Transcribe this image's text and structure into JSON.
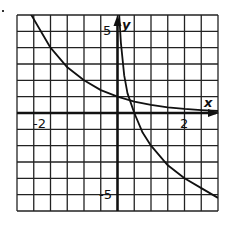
{
  "chart_data": {
    "type": "line",
    "title": "",
    "xlabel": "x",
    "ylabel": "y",
    "xlim": [
      -3,
      3
    ],
    "ylim": [
      -6,
      6
    ],
    "grid": true,
    "x_grid_step": 0.5,
    "y_grid_step": 1,
    "x_tick_labels": [
      {
        "value": -2,
        "label": "-2"
      },
      {
        "value": 2,
        "label": "2"
      }
    ],
    "y_tick_labels": [
      {
        "value": 5,
        "label": "5"
      },
      {
        "value": -5,
        "label": "-5"
      }
    ],
    "series": [
      {
        "name": "exponential-decay-curve",
        "x": [
          -2.6,
          -2,
          -1.5,
          -1,
          -0.5,
          0,
          0.5,
          1,
          1.5,
          2,
          2.5,
          3
        ],
        "y": [
          6.1,
          4,
          2.8,
          2,
          1.4,
          1,
          0.7,
          0.5,
          0.35,
          0.25,
          0.18,
          0.12
        ]
      },
      {
        "name": "logarithmic-curve",
        "x": [
          0.05,
          0.1,
          0.2,
          0.3,
          0.5,
          0.75,
          1,
          1.5,
          2,
          2.5,
          3
        ],
        "y": [
          6,
          4.3,
          2.3,
          1.2,
          0,
          -1.2,
          -2,
          -3.2,
          -4,
          -4.6,
          -5.2
        ]
      }
    ],
    "legend": []
  },
  "labels": {
    "x_axis": "x",
    "y_axis": "y",
    "x_neg2": "-2",
    "x_pos2": "2",
    "y_pos5": "5",
    "y_neg5": "-5"
  }
}
